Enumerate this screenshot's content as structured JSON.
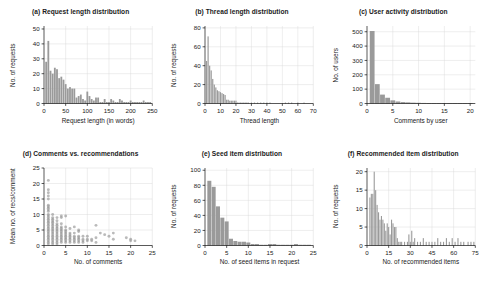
{
  "figure": {
    "panel_count": 6,
    "background": "#ffffff",
    "bar_color": "#9a9a9a",
    "point_color": "#8f8f8f",
    "grid_color": "#d9d9d9"
  },
  "chart_data": [
    {
      "id": "a",
      "type": "bar",
      "title": "(a) Request length distribution",
      "xlabel": "Request length (in words)",
      "ylabel": "No. of requests",
      "xlim": [
        0,
        250
      ],
      "ylim": [
        0,
        52
      ],
      "xticks": [
        0,
        50,
        100,
        150,
        200,
        250
      ],
      "yticks": [
        0,
        10,
        20,
        30,
        40,
        50
      ],
      "grid": true,
      "bin_width": 5,
      "x": [
        5,
        10,
        15,
        20,
        25,
        30,
        35,
        40,
        45,
        50,
        55,
        60,
        65,
        70,
        75,
        80,
        85,
        90,
        95,
        100,
        105,
        110,
        115,
        120,
        125,
        130,
        135,
        140,
        145,
        150,
        155,
        160,
        165,
        170,
        175,
        180,
        185,
        190,
        195,
        200,
        205,
        210,
        215,
        220,
        225,
        230,
        235,
        240,
        245
      ],
      "values": [
        28,
        42,
        22,
        20,
        24,
        23,
        17,
        18,
        16,
        13,
        10,
        11,
        10,
        10,
        4,
        5,
        6,
        3,
        2,
        8,
        5,
        3,
        2,
        4,
        4,
        1,
        1,
        3,
        1,
        1,
        3,
        2,
        1,
        1,
        3,
        2,
        1,
        1,
        1,
        2,
        1,
        1,
        1,
        1,
        1,
        2,
        1,
        1,
        1
      ]
    },
    {
      "id": "b",
      "type": "bar",
      "title": "(b) Thread length distribution",
      "xlabel": "Thread length",
      "ylabel": "No. of requests",
      "xlim": [
        0,
        70
      ],
      "ylim": [
        0,
        82
      ],
      "xticks": [
        0,
        10,
        20,
        30,
        40,
        50,
        60,
        70
      ],
      "yticks": [
        0,
        20,
        40,
        60,
        80
      ],
      "grid": true,
      "bin_width": 1,
      "x": [
        1,
        2,
        3,
        4,
        5,
        6,
        7,
        8,
        9,
        10,
        11,
        12,
        13,
        14,
        15,
        16,
        17,
        18,
        19,
        20,
        21,
        22,
        23,
        24,
        25,
        26,
        27,
        28,
        30,
        32,
        34,
        36,
        38,
        40,
        42,
        52,
        54,
        56,
        60,
        64
      ],
      "values": [
        45,
        71,
        40,
        35,
        26,
        20,
        17,
        14,
        13,
        12,
        11,
        10,
        9,
        4,
        4,
        3,
        3,
        3,
        3,
        3,
        1,
        1,
        1,
        1,
        1,
        1,
        1,
        1,
        1,
        1,
        1,
        1,
        1,
        1,
        1,
        1,
        1,
        1,
        1,
        1
      ]
    },
    {
      "id": "c",
      "type": "bar",
      "title": "(c) User activity distribution",
      "xlabel": "Comments by user",
      "ylabel": "No. of users",
      "xlim": [
        0,
        21
      ],
      "ylim": [
        0,
        540
      ],
      "xticks": [
        0,
        5,
        10,
        15,
        20
      ],
      "yticks": [
        0,
        100,
        200,
        300,
        400,
        500
      ],
      "grid": true,
      "bin_width": 1,
      "x": [
        1,
        2,
        3,
        4,
        5,
        6,
        7,
        8,
        9,
        10,
        11,
        12,
        13,
        14,
        15,
        16,
        17,
        18,
        19,
        20
      ],
      "values": [
        505,
        135,
        62,
        40,
        22,
        14,
        10,
        8,
        6,
        5,
        4,
        3,
        3,
        2,
        2,
        2,
        2,
        1,
        1,
        1
      ]
    },
    {
      "id": "d",
      "type": "scatter",
      "title": "(d) Comments vs. recommendations",
      "xlabel": "No. of comments",
      "ylabel": "Mean no. of recs/comment",
      "xlim": [
        0,
        25
      ],
      "ylim": [
        0,
        25
      ],
      "xticks": [
        0,
        5,
        10,
        15,
        20,
        25
      ],
      "yticks": [
        0,
        5,
        10,
        15,
        20,
        25
      ],
      "grid": true,
      "points": [
        [
          1,
          21
        ],
        [
          1,
          18
        ],
        [
          1,
          17
        ],
        [
          1,
          16
        ],
        [
          1,
          15
        ],
        [
          1,
          13
        ],
        [
          1,
          12.5
        ],
        [
          1,
          12
        ],
        [
          1,
          11.5
        ],
        [
          1,
          11
        ],
        [
          1,
          10
        ],
        [
          1,
          9.5
        ],
        [
          1,
          9
        ],
        [
          1,
          8.5
        ],
        [
          1,
          8
        ],
        [
          1,
          7.5
        ],
        [
          1,
          7
        ],
        [
          1,
          6.5
        ],
        [
          1,
          6
        ],
        [
          1,
          5.5
        ],
        [
          1,
          5
        ],
        [
          1,
          4.5
        ],
        [
          1,
          4
        ],
        [
          1,
          3.5
        ],
        [
          1,
          3
        ],
        [
          1,
          2.5
        ],
        [
          1,
          2
        ],
        [
          1,
          1.5
        ],
        [
          1,
          1
        ],
        [
          1,
          0.5
        ],
        [
          2,
          10
        ],
        [
          2,
          9
        ],
        [
          2,
          8.5
        ],
        [
          2,
          8
        ],
        [
          2,
          7.5
        ],
        [
          2,
          7
        ],
        [
          2,
          6.5
        ],
        [
          2,
          6
        ],
        [
          2,
          5.5
        ],
        [
          2,
          5
        ],
        [
          2,
          4.5
        ],
        [
          2,
          4
        ],
        [
          2,
          3.5
        ],
        [
          2,
          3
        ],
        [
          2,
          2.5
        ],
        [
          2,
          2
        ],
        [
          2,
          1.5
        ],
        [
          2,
          1
        ],
        [
          2,
          0.5
        ],
        [
          3,
          9
        ],
        [
          3,
          8
        ],
        [
          3,
          7
        ],
        [
          3,
          6.5
        ],
        [
          3,
          6
        ],
        [
          3,
          5.5
        ],
        [
          3,
          5
        ],
        [
          3,
          4.5
        ],
        [
          3,
          4
        ],
        [
          3,
          3.5
        ],
        [
          3,
          3
        ],
        [
          3,
          2.5
        ],
        [
          3,
          2
        ],
        [
          3,
          1.5
        ],
        [
          3,
          1
        ],
        [
          3,
          0.5
        ],
        [
          4,
          9.5
        ],
        [
          4,
          9
        ],
        [
          4,
          7
        ],
        [
          4,
          6
        ],
        [
          4,
          5.5
        ],
        [
          4,
          5
        ],
        [
          4,
          4.5
        ],
        [
          4,
          4
        ],
        [
          4,
          3.5
        ],
        [
          4,
          3
        ],
        [
          4,
          2.5
        ],
        [
          4,
          2
        ],
        [
          4,
          1.5
        ],
        [
          4,
          1
        ],
        [
          5,
          9.5
        ],
        [
          5,
          6
        ],
        [
          5,
          5
        ],
        [
          5,
          4.5
        ],
        [
          5,
          4
        ],
        [
          5,
          3.5
        ],
        [
          5,
          3
        ],
        [
          5,
          2.5
        ],
        [
          5,
          2
        ],
        [
          5,
          1.5
        ],
        [
          5,
          1
        ],
        [
          6,
          5.5
        ],
        [
          6,
          4
        ],
        [
          6,
          3.5
        ],
        [
          6,
          3
        ],
        [
          6,
          2.5
        ],
        [
          6,
          2
        ],
        [
          6,
          1.5
        ],
        [
          6,
          1
        ],
        [
          7,
          6
        ],
        [
          7,
          4
        ],
        [
          7,
          3
        ],
        [
          7,
          2.5
        ],
        [
          7,
          2
        ],
        [
          7,
          1.5
        ],
        [
          7,
          1
        ],
        [
          8,
          5
        ],
        [
          8,
          4.5
        ],
        [
          8,
          3
        ],
        [
          8,
          2.5
        ],
        [
          8,
          2
        ],
        [
          8,
          1.5
        ],
        [
          8,
          1
        ],
        [
          9,
          3
        ],
        [
          9,
          2
        ],
        [
          9,
          1.5
        ],
        [
          9,
          1
        ],
        [
          10,
          3
        ],
        [
          10,
          2
        ],
        [
          10,
          1.5
        ],
        [
          11,
          2
        ],
        [
          11,
          1.5
        ],
        [
          12,
          6.5
        ],
        [
          12,
          2.5
        ],
        [
          12,
          1
        ],
        [
          13,
          4
        ],
        [
          14,
          3.5
        ],
        [
          15,
          3
        ],
        [
          16,
          4
        ],
        [
          16,
          2
        ],
        [
          19,
          2.5
        ],
        [
          20,
          2
        ],
        [
          20,
          1.5
        ],
        [
          21,
          1.5
        ]
      ]
    },
    {
      "id": "e",
      "type": "bar",
      "title": "(e) Seed item distribution",
      "xlabel": "No. of seed items in request",
      "ylabel": "No. of requests",
      "xlim": [
        0,
        25
      ],
      "ylim": [
        0,
        103
      ],
      "xticks": [
        0,
        5,
        10,
        15,
        20,
        25
      ],
      "yticks": [
        0,
        20,
        40,
        60,
        80,
        100
      ],
      "grid": true,
      "bin_width": 1,
      "x": [
        1,
        2,
        3,
        4,
        5,
        6,
        7,
        8,
        9,
        10,
        11,
        12,
        13,
        14,
        15,
        16,
        17,
        18,
        19,
        20,
        21,
        22,
        23,
        24
      ],
      "values": [
        86,
        78,
        52,
        37,
        32,
        9,
        6,
        5,
        5,
        4,
        2,
        2,
        1,
        1,
        2,
        2,
        1,
        1,
        1,
        1,
        2,
        1,
        1,
        1
      ]
    },
    {
      "id": "f",
      "type": "bar",
      "title": "(f) Recommended item distribution",
      "xlabel": "No. of recommended items",
      "ylabel": "No. of requests",
      "xlim": [
        0,
        75
      ],
      "ylim": [
        0,
        21
      ],
      "xticks": [
        0,
        15,
        30,
        45,
        60,
        75
      ],
      "yticks": [
        0,
        5,
        10,
        15,
        20
      ],
      "grid": true,
      "bin_width": 1,
      "x": [
        2,
        3,
        4,
        5,
        6,
        7,
        8,
        9,
        10,
        11,
        12,
        13,
        14,
        15,
        16,
        17,
        18,
        19,
        20,
        21,
        22,
        23,
        24,
        26,
        28,
        29,
        30,
        31,
        32,
        33,
        35,
        37,
        39,
        41,
        43,
        45,
        47,
        49,
        51,
        53,
        55,
        57,
        59,
        61,
        63,
        65,
        67,
        70,
        72,
        74
      ],
      "values": [
        13,
        14,
        14,
        20,
        15,
        11,
        9,
        7,
        8,
        7,
        6,
        4,
        6,
        5,
        3,
        7,
        6,
        5,
        5,
        2,
        1,
        1,
        1,
        1,
        1,
        3,
        1,
        4,
        1,
        2,
        1,
        1,
        2,
        1,
        1,
        1,
        1,
        2,
        1,
        1,
        2,
        1,
        2,
        1,
        2,
        1,
        1,
        1,
        1,
        1
      ]
    }
  ]
}
